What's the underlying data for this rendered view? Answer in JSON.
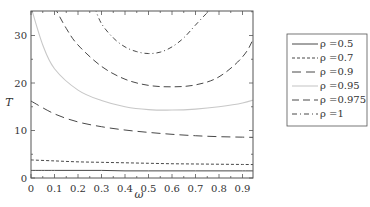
{
  "chart_data": {
    "type": "line",
    "title": "",
    "xlabel": "ω",
    "ylabel": "T",
    "xlim": [
      0,
      1
    ],
    "ylim": [
      0,
      36
    ],
    "grid": false,
    "legend_position": "right-outside",
    "xticks": [
      "0",
      "0.1",
      "0.2",
      "0.3",
      "0.4",
      "0.5",
      "0.6",
      "0.7",
      "0.8",
      "0.9"
    ],
    "yticks": [
      "0",
      "10",
      "20",
      "30"
    ],
    "series": [
      {
        "name": "ρ =0.5",
        "style": "solid",
        "color": "#333333",
        "x": [
          0,
          0.1,
          0.2,
          0.3,
          0.4,
          0.5,
          0.6,
          0.7,
          0.8,
          0.9,
          1.0
        ],
        "values": [
          1.6,
          1.6,
          1.6,
          1.6,
          1.5,
          1.5,
          1.5,
          1.5,
          1.5,
          1.5,
          1.5
        ]
      },
      {
        "name": "ρ =0.7",
        "style": "short-dash",
        "color": "#333333",
        "x": [
          0,
          0.1,
          0.2,
          0.3,
          0.4,
          0.5,
          0.6,
          0.7,
          0.8,
          0.9,
          1.0
        ],
        "values": [
          3.8,
          3.6,
          3.4,
          3.3,
          3.2,
          3.1,
          3.0,
          2.95,
          2.9,
          2.85,
          2.8
        ]
      },
      {
        "name": "ρ =0.9",
        "style": "long-dash",
        "color": "#333333",
        "x": [
          0,
          0.1,
          0.2,
          0.3,
          0.4,
          0.5,
          0.6,
          0.7,
          0.8,
          0.9,
          1.0
        ],
        "values": [
          16.2,
          13.5,
          11.8,
          10.8,
          10.1,
          9.6,
          9.2,
          8.9,
          8.7,
          8.6,
          8.5
        ]
      },
      {
        "name": "ρ =0.95",
        "style": "solid-light",
        "color": "#c8c8c8",
        "x": [
          0,
          0.05,
          0.1,
          0.2,
          0.3,
          0.4,
          0.5,
          0.6,
          0.7,
          0.8,
          0.9,
          1.0
        ],
        "values": [
          36,
          28,
          23,
          18.5,
          16.3,
          15.0,
          14.4,
          14.3,
          14.5,
          15.0,
          15.8,
          17.2
        ]
      },
      {
        "name": "ρ =0.975",
        "style": "dash",
        "color": "#333333",
        "x": [
          0.1,
          0.15,
          0.2,
          0.3,
          0.4,
          0.5,
          0.6,
          0.7,
          0.8,
          0.9,
          0.95,
          0.97
        ],
        "values": [
          36,
          31.5,
          28,
          23.5,
          20.8,
          19.5,
          19.2,
          19.6,
          21.3,
          25.5,
          30,
          36
        ]
      },
      {
        "name": "ρ =1",
        "style": "dash-dot",
        "color": "#333333",
        "x": [
          0.27,
          0.3,
          0.35,
          0.4,
          0.45,
          0.5,
          0.55,
          0.6,
          0.65,
          0.7,
          0.75,
          0.78
        ],
        "values": [
          36,
          32.5,
          29.5,
          27.6,
          26.6,
          26.2,
          26.5,
          27.6,
          29.5,
          32.2,
          34.8,
          36
        ]
      }
    ]
  }
}
